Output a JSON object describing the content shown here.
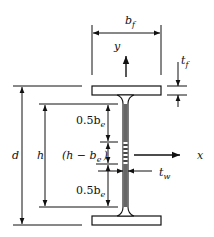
{
  "diagram": {
    "labels": {
      "flange_width": "b",
      "flange_width_sub": "f",
      "flange_thickness": "t",
      "flange_thickness_sub": "f",
      "web_thickness": "t",
      "web_thickness_sub": "w",
      "total_depth": "d",
      "web_height": "h",
      "y_axis": "y",
      "x_axis": "x",
      "top_effective": "0.5b",
      "top_effective_sub": "e",
      "middle_ineffective": "(h − b",
      "middle_ineffective_sub": "e",
      "middle_ineffective_close": ")",
      "bottom_effective": "0.5b",
      "bottom_effective_sub": "e"
    },
    "colors": {
      "stroke": "#111111",
      "background": "#ffffff",
      "web_fill": "#555555"
    }
  }
}
